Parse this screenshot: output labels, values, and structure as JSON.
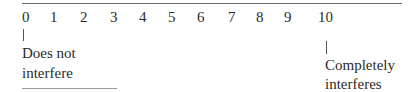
{
  "scale": {
    "ticks": [
      "0",
      "1",
      "2",
      "3",
      "4",
      "5",
      "6",
      "7",
      "8",
      "9",
      "10"
    ],
    "min_anchor": {
      "value": "0",
      "label_line1": "Does not",
      "label_line2": "interfere"
    },
    "max_anchor": {
      "value": "10",
      "label_line1": "Completely",
      "label_line2": "interferes"
    }
  }
}
